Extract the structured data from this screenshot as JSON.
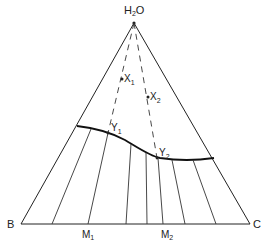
{
  "diagram": {
    "type": "ternary-phase-diagram",
    "vertices": {
      "top": {
        "label": "H",
        "sub": "2",
        "suffix": "O"
      },
      "left": {
        "label": "B"
      },
      "right": {
        "label": "C"
      }
    },
    "points": [
      {
        "label": "X",
        "sub": "1"
      },
      {
        "label": "X",
        "sub": "2"
      },
      {
        "label": "Y",
        "sub": "1"
      },
      {
        "label": "Y",
        "sub": "2"
      }
    ],
    "base_points": [
      {
        "label": "M",
        "sub": "1"
      },
      {
        "label": "M",
        "sub": "2"
      }
    ],
    "colors": {
      "line": "#222222",
      "background": "#ffffff"
    }
  }
}
